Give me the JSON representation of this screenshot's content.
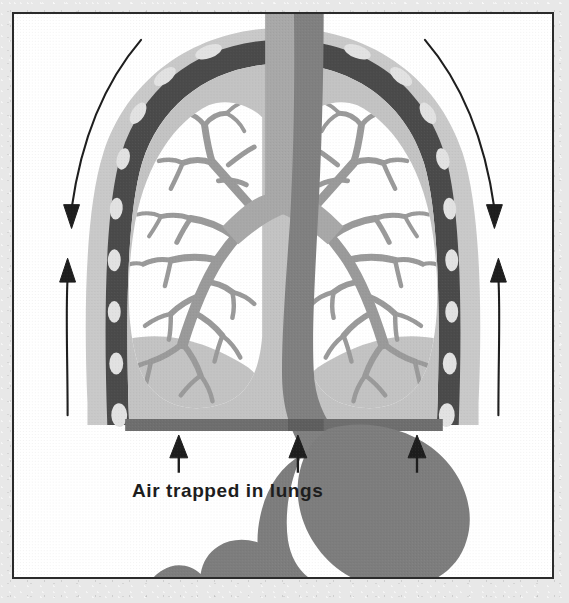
{
  "figure": {
    "title": "Air trapped in lungs",
    "caption": "Air trapped in lungs",
    "background_color": "#e8e8e8",
    "plate_background": "#ffffff",
    "border_color": "#2b2b2b"
  },
  "palette": {
    "rib_band": "#4a4a4a",
    "rib_oval": "#e2e2e2",
    "pleura_outer": "#c9c9c9",
    "thorax_fill": "#c3c3c3",
    "lung_air": "#ffffff",
    "bronchial_tree": "#9a9a9a",
    "trachea": "#a8a8a8",
    "esophagus": "#808080",
    "stomach": "#7d7d7d",
    "diaphragm": "#6e6e6e",
    "arrow": "#1d1d1d"
  },
  "anatomy": {
    "parts": [
      {
        "id": "rib-cage",
        "label": "Rib cage",
        "color": "#4a4a4a"
      },
      {
        "id": "rib-cross-sections",
        "label": "Rib cross sections",
        "color": "#e2e2e2",
        "count": 16
      },
      {
        "id": "pleural-lining",
        "label": "Pleural lining",
        "color": "#c9c9c9"
      },
      {
        "id": "thoracic-cavity",
        "label": "Thoracic cavity",
        "color": "#c3c3c3"
      },
      {
        "id": "left-lung",
        "label": "Left lung",
        "color": "#ffffff"
      },
      {
        "id": "right-lung",
        "label": "Right lung",
        "color": "#ffffff"
      },
      {
        "id": "bronchial-tree",
        "label": "Bronchial tree",
        "color": "#9a9a9a"
      },
      {
        "id": "trachea",
        "label": "Trachea",
        "color": "#a8a8a8"
      },
      {
        "id": "esophagus",
        "label": "Esophagus",
        "color": "#808080"
      },
      {
        "id": "diaphragm",
        "label": "Flattened diaphragm",
        "color": "#6e6e6e"
      },
      {
        "id": "stomach",
        "label": "Stomach",
        "color": "#7d7d7d"
      },
      {
        "id": "duodenum",
        "label": "Duodenum",
        "color": "#7d7d7d"
      }
    ]
  },
  "annotations": {
    "chest_motion_arrows": [
      {
        "id": "left-down-arrow",
        "side": "left",
        "direction": "down",
        "meaning": "chest wall expansion outward/down"
      },
      {
        "id": "left-up-arrow",
        "side": "left",
        "direction": "up",
        "meaning": "chest wall recoil upward"
      },
      {
        "id": "right-down-arrow",
        "side": "right",
        "direction": "down",
        "meaning": "chest wall expansion outward/down"
      },
      {
        "id": "right-up-arrow",
        "side": "right",
        "direction": "up",
        "meaning": "chest wall recoil upward"
      }
    ],
    "diaphragm_pressure_arrows": [
      {
        "id": "diaphragm-arrow-left",
        "direction": "up"
      },
      {
        "id": "diaphragm-arrow-center",
        "direction": "up"
      },
      {
        "id": "diaphragm-arrow-right",
        "direction": "up"
      }
    ]
  }
}
